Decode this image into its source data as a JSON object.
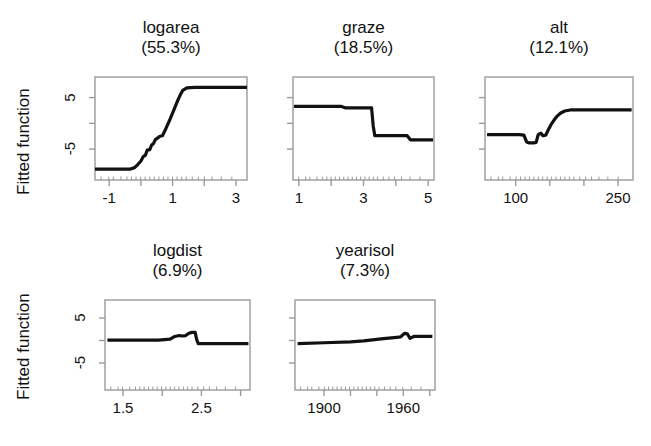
{
  "figure": {
    "ylabel_top": "Fitted function",
    "ylabel_bottom": "Fitted function",
    "background": "#ffffff",
    "line_color": "#111111",
    "axis_color": "#9a9a9a"
  },
  "chart_data": {
    "type": "line",
    "title": "",
    "ylabel": "Fitted function",
    "layout": {
      "rows": 2,
      "cols": 3,
      "grid": false,
      "legend": "none"
    },
    "ylim": [
      -11,
      9
    ],
    "yticks": [
      -5,
      5
    ],
    "ytick_labels": [
      "-5",
      "5"
    ],
    "panels": [
      {
        "name": "logarea",
        "title": "logarea",
        "contribution": "(55.3%)",
        "contribution_pct": 55.3,
        "xlabel": "",
        "xlim": [
          -1.45,
          3.35
        ],
        "xticks": [
          -1,
          0,
          1,
          2,
          3
        ],
        "xtick_labels": [
          "-1",
          "",
          "1",
          "",
          "3"
        ],
        "ylim": [
          -11,
          9
        ],
        "x": [
          -1.45,
          -0.35,
          -0.2,
          -0.1,
          0.0,
          0.08,
          0.14,
          0.2,
          0.28,
          0.34,
          0.4,
          0.46,
          0.52,
          0.6,
          0.68,
          0.76,
          0.84,
          0.92,
          1.0,
          1.08,
          1.16,
          1.24,
          1.32,
          1.45,
          1.7,
          2.2,
          3.35
        ],
        "y": [
          -8.9,
          -8.9,
          -8.6,
          -8.0,
          -7.3,
          -6.4,
          -6.2,
          -5.2,
          -5.1,
          -4.2,
          -3.9,
          -3.1,
          -2.9,
          -2.5,
          -2.4,
          -1.4,
          -0.3,
          0.8,
          2.0,
          3.2,
          4.4,
          5.5,
          6.4,
          6.9,
          7.0,
          7.0,
          7.0
        ]
      },
      {
        "name": "graze",
        "title": "graze",
        "contribution": "(18.5%)",
        "contribution_pct": 18.5,
        "xlabel": "",
        "xlim": [
          0.82,
          5.18
        ],
        "xticks": [
          1,
          2,
          3,
          4,
          5
        ],
        "xtick_labels": [
          "1",
          "",
          "3",
          "",
          "5"
        ],
        "ylim": [
          -11,
          9
        ],
        "x": [
          0.85,
          2.3,
          2.45,
          3.25,
          3.3,
          3.35,
          4.35,
          4.45,
          5.15
        ],
        "y": [
          3.3,
          3.3,
          3.0,
          3.0,
          -0.5,
          -2.4,
          -2.4,
          -3.2,
          -3.2
        ]
      },
      {
        "name": "alt",
        "title": "alt",
        "contribution": "(12.1%)",
        "contribution_pct": 12.1,
        "xlabel": "",
        "xlim": [
          55,
          272
        ],
        "xticks": [
          100,
          150,
          200,
          250
        ],
        "xtick_labels": [
          "100",
          "",
          "",
          "250"
        ],
        "ylim": [
          -11,
          9
        ],
        "x": [
          58,
          105,
          112,
          116,
          120,
          126,
          130,
          133,
          137,
          140,
          144,
          148,
          152,
          156,
          160,
          166,
          172,
          180,
          195,
          230,
          270
        ],
        "y": [
          -2.2,
          -2.2,
          -2.3,
          -3.6,
          -3.8,
          -3.8,
          -3.7,
          -2.2,
          -1.9,
          -2.4,
          -2.3,
          -1.2,
          -0.2,
          0.6,
          1.3,
          2.0,
          2.4,
          2.6,
          2.6,
          2.6,
          2.6
        ]
      },
      {
        "name": "logdist",
        "title": "logdist",
        "contribution": "(6.9%)",
        "contribution_pct": 6.9,
        "xlabel": "",
        "xlim": [
          1.27,
          3.12
        ],
        "xticks": [
          1.5,
          2.0,
          2.5,
          3.0
        ],
        "xtick_labels": [
          "1.5",
          "",
          "2.5",
          ""
        ],
        "ylim": [
          -11,
          9
        ],
        "x": [
          1.3,
          1.95,
          2.1,
          2.16,
          2.22,
          2.26,
          2.3,
          2.34,
          2.38,
          2.42,
          2.44,
          2.46,
          2.5,
          2.7,
          3.1
        ],
        "y": [
          0.1,
          0.1,
          0.3,
          0.9,
          1.1,
          1.0,
          1.1,
          1.6,
          1.8,
          1.8,
          0.2,
          -0.7,
          -0.7,
          -0.7,
          -0.7
        ]
      },
      {
        "name": "yearisol",
        "title": "yearisol",
        "contribution": "(7.3%)",
        "contribution_pct": 7.3,
        "xlabel": "",
        "xlim": [
          1878,
          1984
        ],
        "xticks": [
          1900,
          1920,
          1940,
          1960,
          1980
        ],
        "xtick_labels": [
          "1900",
          "",
          "",
          "1960",
          ""
        ],
        "ylim": [
          -11,
          9
        ],
        "x": [
          1880,
          1900,
          1920,
          1930,
          1945,
          1955,
          1958,
          1961,
          1963,
          1965,
          1968,
          1982
        ],
        "y": [
          -0.7,
          -0.5,
          -0.3,
          -0.1,
          0.4,
          0.7,
          0.8,
          1.6,
          1.5,
          0.5,
          0.9,
          0.9
        ]
      }
    ]
  }
}
